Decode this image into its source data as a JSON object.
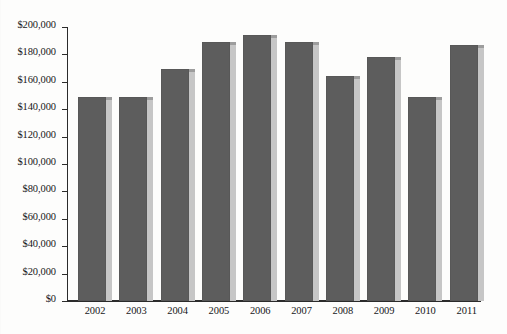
{
  "chart_data": {
    "type": "bar",
    "title": "",
    "subtitle": "",
    "xlabel": "",
    "ylabel": "",
    "categories": [
      "2002",
      "2003",
      "2004",
      "2005",
      "2006",
      "2007",
      "2008",
      "2009",
      "2010",
      "2011"
    ],
    "values": [
      149000,
      149000,
      169000,
      189000,
      194000,
      189000,
      164000,
      178000,
      149000,
      187000
    ],
    "series": [
      {
        "name": "",
        "values": [
          149000,
          149000,
          169000,
          189000,
          194000,
          189000,
          164000,
          178000,
          149000,
          187000
        ]
      }
    ],
    "ylim": [
      0,
      200000
    ],
    "ytick_values": [
      0,
      20000,
      40000,
      60000,
      80000,
      100000,
      120000,
      140000,
      160000,
      180000,
      200000
    ],
    "ytick_labels": [
      "$0",
      "$20,000",
      "$40,000",
      "$60,000",
      "$80,000",
      "$100,000",
      "$120,000",
      "$140,000",
      "$160,000",
      "$180,000",
      "$200,000"
    ],
    "xtick_labels": [
      "2002",
      "2003",
      "2004",
      "2005",
      "2006",
      "2007",
      "2008",
      "2009",
      "2010",
      "2011"
    ],
    "grid": false,
    "legend": null,
    "annotations": [],
    "colors": {
      "bar_fill": "#5d5d5d",
      "bar_shadow": "#c6c6c6",
      "bar_shadow_top": "#9d9d9d",
      "axis": "#2b2b2b",
      "text": "#17171a",
      "background": "#fdfdfc"
    }
  }
}
